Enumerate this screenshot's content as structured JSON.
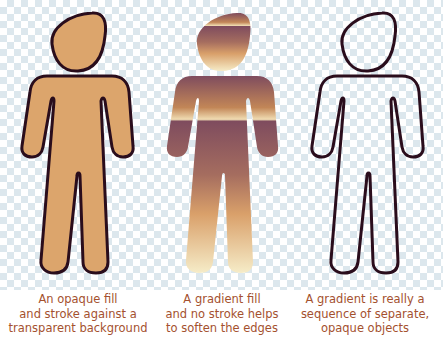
{
  "background": {
    "pattern": "transparency-checkerboard",
    "colors": [
      "#ffffff",
      "#d6e3ea"
    ]
  },
  "figures": [
    {
      "id": "opaque",
      "fill": "#dca56c",
      "stroke": "#2a0d1c",
      "caption_lines": [
        "An opaque fill",
        "and stroke against a",
        "transparent background"
      ]
    },
    {
      "id": "gradient",
      "gradient_stops": [
        "#7f4c5e",
        "#b5785a",
        "#dba269",
        "#f5e8c4"
      ],
      "stroke": "none",
      "caption_lines": [
        "A gradient fill",
        "and no stroke helps",
        "to soften the edges"
      ]
    },
    {
      "id": "banded",
      "stroke": "#2a0d1c",
      "band_colors": [
        "#7d5060",
        "#835463",
        "#8a5b64",
        "#926466",
        "#9b6b66",
        "#a67568",
        "#b48264",
        "#c49164",
        "#d6a66c",
        "#dfb47f",
        "#e5c692",
        "#ead3a8",
        "#efdfbd",
        "#f3e8cd"
      ],
      "caption_lines": [
        "A gradient is really a",
        "sequence of separate,",
        "opaque objects"
      ]
    }
  ],
  "caption_color": "#a4512f"
}
